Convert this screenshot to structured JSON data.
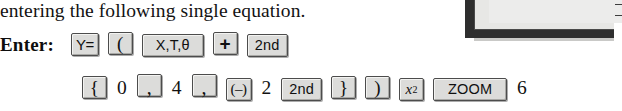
{
  "page": {
    "body_text": "entering the following single equation.",
    "enter_label": "Enter:"
  },
  "figure": {
    "name": "calculator-screen-partial",
    "caption": ""
  },
  "keystrokes": {
    "row1": [
      {
        "type": "key",
        "label": "Y=",
        "style": "y-equals",
        "width": "narrow"
      },
      {
        "type": "key",
        "label": "(",
        "style": "serif-glyph",
        "width": "narrow"
      },
      {
        "type": "key",
        "label": "X,T,θ",
        "style": "plain",
        "width": "wide"
      },
      {
        "type": "key",
        "label": "+",
        "style": "plus-glyph",
        "width": "narrow"
      },
      {
        "type": "key",
        "label": "2nd",
        "style": "plain",
        "width": "normal"
      }
    ],
    "row2": [
      {
        "type": "key",
        "label": "{",
        "style": "serif-glyph",
        "width": "narrow"
      },
      {
        "type": "digit",
        "label": "0"
      },
      {
        "type": "key",
        "label": ",",
        "style": "comma-glyph",
        "width": "narrow"
      },
      {
        "type": "digit",
        "label": "4"
      },
      {
        "type": "key",
        "label": ",",
        "style": "comma-glyph",
        "width": "narrow"
      },
      {
        "type": "key",
        "label": "(–)",
        "style": "neg-glyph",
        "width": "narrow"
      },
      {
        "type": "digit",
        "label": "2"
      },
      {
        "type": "key",
        "label": "2nd",
        "style": "plain",
        "width": "normal"
      },
      {
        "type": "key",
        "label": "}",
        "style": "serif-glyph",
        "width": "narrow"
      },
      {
        "type": "key",
        "label": ")",
        "style": "serif-glyph",
        "width": "narrow"
      },
      {
        "type": "key",
        "label": "x²",
        "style": "italic-glyph",
        "width": "narrow"
      },
      {
        "type": "key",
        "label": "ZOOM",
        "style": "plain",
        "width": "xwide"
      },
      {
        "type": "digit",
        "label": "6",
        "trailing": true
      }
    ]
  },
  "colors": {
    "page_background": "#ffffff",
    "text": "#111111",
    "key_face": "#dcdcda",
    "key_border": "#4c4c4c",
    "figure_shadow": "#2e2e2e",
    "figure_screen": "#ececeb"
  }
}
